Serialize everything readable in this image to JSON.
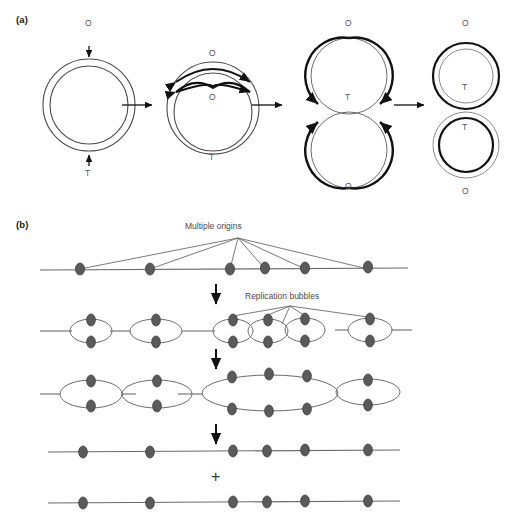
{
  "figure": {
    "title_a": "(a)",
    "title_b": "(b)",
    "panel_a": {
      "description": "Bidirectional replication of a circular bacterial chromosome",
      "stages": [
        {
          "name": "unreplicated-circle",
          "labels": [
            {
              "text": "O",
              "role": "origin",
              "x": 89,
              "y": 38
            },
            {
              "text": "T",
              "role": "terminus",
              "x": 89,
              "y": 172
            }
          ]
        },
        {
          "name": "theta-structure",
          "labels": [
            {
              "text": "O",
              "role": "origin-outer",
              "x": 213,
              "y": 58
            },
            {
              "text": "O",
              "role": "origin-inner",
              "x": 213,
              "y": 98
            },
            {
              "text": "T",
              "role": "terminus",
              "x": 213,
              "y": 158
            }
          ]
        },
        {
          "name": "late-theta-two-lobes",
          "labels": [
            {
              "text": "O",
              "role": "origin-top",
              "x": 349,
              "y": 25
            },
            {
              "text": "T",
              "role": "terminus-top",
              "x": 349,
              "y": 100
            },
            {
              "text": "T",
              "role": "terminus-bottom",
              "x": 349,
              "y": 108
            },
            {
              "text": "O",
              "role": "origin-bottom",
              "x": 349,
              "y": 187
            }
          ]
        },
        {
          "name": "two-daughter-circles",
          "labels": [
            {
              "text": "O",
              "role": "origin-top",
              "x": 466,
              "y": 25
            },
            {
              "text": "T",
              "role": "terminus-top",
              "x": 466,
              "y": 89
            },
            {
              "text": "T",
              "role": "terminus-bottom",
              "x": 466,
              "y": 129
            },
            {
              "text": "O",
              "role": "origin-bottom",
              "x": 466,
              "y": 192
            }
          ]
        }
      ],
      "arrow_count": 3
    },
    "panel_b": {
      "description": "Replication from multiple origins on a eukaryotic linear chromosome",
      "callouts": [
        {
          "text": "Multiple origins",
          "x": 238,
          "y": 226
        },
        {
          "text": "Replication bubbles",
          "x": 290,
          "y": 296
        }
      ],
      "plus_symbol": "+",
      "rows": [
        {
          "name": "linear-dna-with-origins",
          "origins": 6,
          "bubbles": 0
        },
        {
          "name": "small-replication-bubbles",
          "origins": 6,
          "bubbles": 5
        },
        {
          "name": "merged-growing-bubbles",
          "origins": 6,
          "bubbles": 4
        },
        {
          "name": "daughter-strand-top",
          "origins": 6,
          "bubbles": 0
        },
        {
          "name": "daughter-strand-bottom",
          "origins": 6,
          "bubbles": 0
        }
      ],
      "origin_positions": [
        80,
        150,
        230,
        265,
        305,
        368
      ],
      "arrow_count": 3
    },
    "colors": {
      "dot_fill": "#5a5a5a",
      "dot_stroke": "#333333",
      "line": "#6b6b6b",
      "circle_outline": "#4a4a4a",
      "new_strand": "#111111",
      "text": "#555555",
      "background": "#ffffff"
    }
  }
}
